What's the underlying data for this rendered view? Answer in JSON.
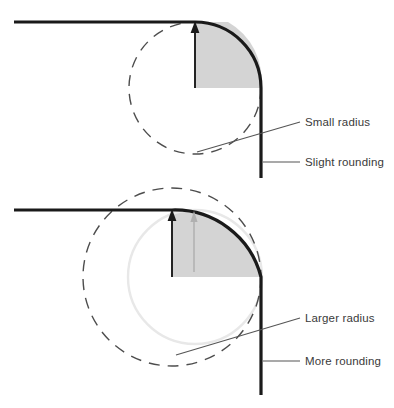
{
  "figure": {
    "width": 394,
    "height": 408,
    "background": "#ffffff"
  },
  "colors": {
    "corner_stroke": "#1a1a1a",
    "dashed_circle": "#4d4d4d",
    "light_circle": "#e8e8e8",
    "fill_gray": "#d4d4d4",
    "arrow_black": "#1a1a1a",
    "arrow_gray": "#b0b0b0",
    "leader_line": "#555555",
    "label_text": "#3a3a3a"
  },
  "panels": [
    {
      "id": "top-panel",
      "name": "small-radius-panel",
      "corner": {
        "radius": 66,
        "center_x": 195,
        "center_y": 88,
        "horizontal_start_x": 14,
        "horizontal_y": 22,
        "vertical_x": 261,
        "vertical_end_y": 178
      },
      "radius_arrow": {
        "from_x": 195,
        "from_y": 88,
        "to_x": 195,
        "to_y": 22,
        "color": "arrow_black"
      },
      "labels": [
        {
          "name": "label-small-radius",
          "text": "Small radius",
          "x": 305,
          "y": 126,
          "leader_from_x": 197,
          "leader_from_y": 152,
          "leader_to_x": 300,
          "leader_to_y": 122
        },
        {
          "name": "label-slight-rounding",
          "text": "Slight rounding",
          "x": 305,
          "y": 166,
          "leader_from_x": 263,
          "leader_from_y": 162,
          "leader_to_x": 300,
          "leader_to_y": 162
        }
      ]
    },
    {
      "id": "bottom-panel",
      "name": "larger-radius-panel",
      "corner": {
        "radius": 89,
        "center_x": 172,
        "center_y": 277,
        "horizontal_start_x": 14,
        "horizontal_y": 210,
        "vertical_x": 261,
        "vertical_end_y": 395
      },
      "reference_circle": {
        "name": "previous-small-radius-circle",
        "center_x": 195,
        "center_y": 277,
        "radius": 67
      },
      "dashed_circle": {
        "center_x": 172,
        "center_y": 277,
        "radius": 89
      },
      "radius_arrow": {
        "from_x": 172,
        "from_y": 277,
        "to_x": 172,
        "to_y": 210,
        "color": "arrow_black"
      },
      "reference_arrow": {
        "from_x": 194,
        "from_y": 272,
        "to_x": 194,
        "to_y": 212,
        "color": "arrow_gray"
      },
      "labels": [
        {
          "name": "label-larger-radius",
          "text": "Larger radius",
          "x": 305,
          "y": 322,
          "leader_from_x": 176,
          "leader_from_y": 355,
          "leader_to_x": 300,
          "leader_to_y": 318
        },
        {
          "name": "label-more-rounding",
          "text": "More rounding",
          "x": 305,
          "y": 365,
          "leader_from_x": 263,
          "leader_from_y": 361,
          "leader_to_x": 300,
          "leader_to_y": 361
        }
      ]
    }
  ]
}
